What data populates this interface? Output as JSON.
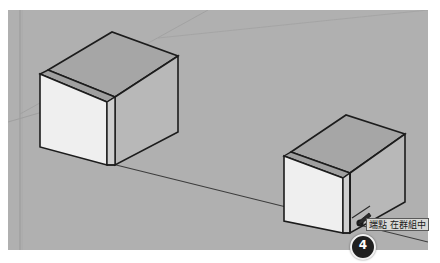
{
  "app": {
    "name": "3d-modeling-viewport",
    "background_color": "#ffffff"
  },
  "viewport": {
    "name": "3d-scene",
    "background_color": "#b0b0b0",
    "axis_line_color": "#9a9a9a",
    "edge_color": "#1c1c1c",
    "inference_line_color": "#3a3a3a"
  },
  "objects": [
    {
      "id": "group-1",
      "label": "Cube Group 1",
      "position": "upper-left",
      "top_face_color": "#a6a6a6",
      "right_face_color": "#b8b8b8",
      "front_face_color": "#efefef",
      "side_face_color": "#cfcfcf"
    },
    {
      "id": "group-2",
      "label": "Cube Group 2",
      "position": "lower-right",
      "top_face_color": "#a6a6a6",
      "right_face_color": "#b8b8b8",
      "front_face_color": "#efefef",
      "side_face_color": "#cfcfcf"
    }
  ],
  "tooltip": {
    "text": "端點 在群組中",
    "background_color": "#d9d9d6",
    "border_color": "#5a5a5a",
    "text_color": "#1a1a1a"
  },
  "cursor": {
    "icon": "pencil-cursor-icon",
    "endpoint_marker": "endpoint-dot"
  },
  "step_badge": {
    "number": "4",
    "background_color": "#202020",
    "text_color": "#ffffff"
  }
}
